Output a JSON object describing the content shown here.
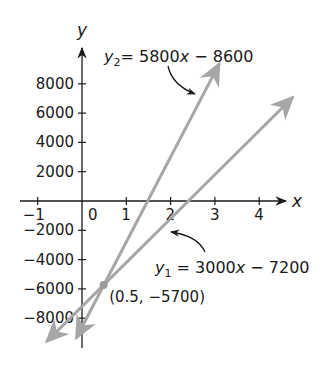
{
  "chart_data": {
    "type": "line",
    "title": "",
    "xlabel": "x",
    "ylabel": "y",
    "xlim": [
      -1.4,
      4.6
    ],
    "ylim": [
      -10000,
      10500
    ],
    "grid": false,
    "x_ticks": [
      -1,
      0,
      1,
      2,
      3,
      4
    ],
    "x_tick_labels": [
      "−1",
      "0",
      "1",
      "2",
      "3",
      "4"
    ],
    "y_ticks": [
      8000,
      6000,
      4000,
      2000,
      -2000,
      -4000,
      -6000,
      -8000
    ],
    "y_tick_labels": [
      "8000",
      "6000",
      "4000",
      "2000",
      "−2000",
      "−4000",
      "−6000",
      "−8000"
    ],
    "series": [
      {
        "name": "y1",
        "equation": "y1 = 3000x − 7200",
        "slope": 3000,
        "intercept": -7200,
        "x": [
          -0.8,
          4.76
        ],
        "y": [
          -9600,
          7080
        ],
        "color": "#a6a6a6"
      },
      {
        "name": "y2",
        "equation": "y2 = 5800x − 8600",
        "slope": 5800,
        "intercept": -8600,
        "x": [
          -0.13,
          3.1
        ],
        "y": [
          -9354,
          9380
        ],
        "color": "#a6a6a6"
      }
    ],
    "annotations": [
      {
        "type": "point",
        "x": 0.5,
        "y": -5700,
        "label": "(0.5, −5700)"
      },
      {
        "type": "callout",
        "target": "y2",
        "text_parts": [
          "y",
          "2",
          "= 5800",
          "x",
          " − 8600"
        ]
      },
      {
        "type": "callout",
        "target": "y1",
        "text_parts": [
          "y",
          "1",
          " = 3000",
          "x",
          " − 7200"
        ]
      }
    ],
    "legend": "none"
  },
  "labels": {
    "x_axis": "x",
    "y_axis": "y",
    "intersection": "(0.5, −5700)",
    "y2_eq": {
      "var": "y",
      "sub": "2",
      "mid": "= 5800",
      "xvar": "x",
      "tail": " − 8600"
    },
    "y1_eq": {
      "var": "y",
      "sub": "1",
      "mid": " = 3000",
      "xvar": "x",
      "tail": " − 7200"
    }
  },
  "colors": {
    "axis": "#1a1a1a",
    "line": "#a6a6a6",
    "point": "#9a9a9a",
    "callout_arrow": "#1a1a1a"
  }
}
